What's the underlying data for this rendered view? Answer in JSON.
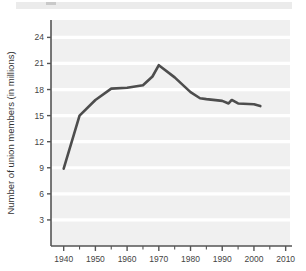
{
  "figure": {
    "background_color": "#ffffff",
    "plot_background_color": "#f0f0f0",
    "gridline_color": "#ffffff",
    "axis_color": "#555555",
    "line_color": "#4d4d4d"
  },
  "top_band": {
    "name": "cropped-header-band",
    "color": "#ebebeb",
    "tick_color": "#c9c9c9"
  },
  "axes": {
    "y_title": "Number of union members (in millions)",
    "x_title": "",
    "y_ticks": [
      "3",
      "6",
      "9",
      "12",
      "15",
      "18",
      "21",
      "24"
    ],
    "x_ticks": [
      "1940",
      "1950",
      "1960",
      "1970",
      "1980",
      "1990",
      "2000",
      "2010"
    ],
    "x_minor_ticks": [
      "1945",
      "1955",
      "1965",
      "1975",
      "1985",
      "1995",
      "2005"
    ]
  },
  "chart_data": {
    "type": "line",
    "title": "",
    "xlabel": "",
    "ylabel": "Number of union members (in millions)",
    "xlim": [
      1936,
      2012
    ],
    "ylim": [
      0,
      26
    ],
    "xtick_values": [
      1940,
      1950,
      1960,
      1970,
      1980,
      1990,
      2000,
      2010
    ],
    "ytick_values": [
      3,
      6,
      9,
      12,
      15,
      18,
      21,
      24
    ],
    "grid": "horizontal",
    "legend": "none",
    "series": [
      {
        "name": "Union members",
        "color": "#4d4d4d",
        "x": [
          1940,
          1945,
          1950,
          1955,
          1960,
          1965,
          1968,
          1970,
          1975,
          1980,
          1983,
          1985,
          1990,
          1992,
          1993,
          1995,
          2000,
          2002
        ],
        "y": [
          8.9,
          15.0,
          16.8,
          18.1,
          18.2,
          18.5,
          19.5,
          20.8,
          19.4,
          17.7,
          17.0,
          16.9,
          16.7,
          16.4,
          16.8,
          16.4,
          16.3,
          16.1
        ]
      }
    ]
  }
}
